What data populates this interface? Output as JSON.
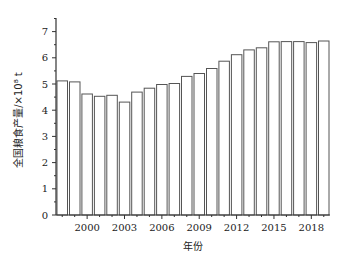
{
  "chart_data": {
    "type": "bar",
    "title": "",
    "xlabel": "年份",
    "ylabel": "全国粮食产量/×10⁸ t",
    "ylim": [
      0,
      7.5
    ],
    "yticks": [
      0,
      1,
      2,
      3,
      4,
      5,
      6,
      7
    ],
    "xtick_labels": [
      "2000",
      "2003",
      "2006",
      "2009",
      "2012",
      "2015",
      "2018"
    ],
    "grid": false,
    "legend": null,
    "categories": [
      "1998",
      "1999",
      "2000",
      "2001",
      "2002",
      "2003",
      "2004",
      "2005",
      "2006",
      "2007",
      "2008",
      "2009",
      "2010",
      "2011",
      "2012",
      "2013",
      "2014",
      "2015",
      "2016",
      "2017",
      "2018",
      "2019"
    ],
    "values": [
      5.12,
      5.08,
      4.62,
      4.53,
      4.57,
      4.31,
      4.69,
      4.84,
      4.98,
      5.02,
      5.29,
      5.4,
      5.59,
      5.87,
      6.12,
      6.3,
      6.38,
      6.61,
      6.62,
      6.62,
      6.58,
      6.64
    ],
    "bar_fill": "#ffffff",
    "bar_stroke": "#555555"
  }
}
